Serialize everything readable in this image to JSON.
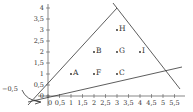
{
  "diagram": {
    "type": "coordinate-plane",
    "x_axis": {
      "ticks": [
        "0",
        "0,5",
        "1",
        "1,5",
        "2",
        "2,5",
        "3",
        "3,5",
        "4",
        "4,5",
        "5",
        "5,5"
      ]
    },
    "y_axis": {
      "ticks": [
        "0",
        "0,5",
        "1",
        "1,5",
        "2",
        "2,5",
        "3",
        "3,5",
        "4"
      ],
      "neg_label": "−0,5"
    },
    "points": [
      {
        "label": "A",
        "x": 1,
        "y": 1
      },
      {
        "label": "F",
        "x": 2,
        "y": 1
      },
      {
        "label": "C",
        "x": 3,
        "y": 1
      },
      {
        "label": "B",
        "x": 2,
        "y": 2
      },
      {
        "label": "G",
        "x": 3,
        "y": 2
      },
      {
        "label": "I",
        "x": 4,
        "y": 2
      },
      {
        "label": "H",
        "x": 3,
        "y": 3
      }
    ],
    "lines": [
      {
        "name": "left-side",
        "from": [
          -0.9,
          -0.4
        ],
        "to": [
          3,
          4
        ]
      },
      {
        "name": "right-side",
        "from": [
          3,
          4
        ],
        "to": [
          5.8,
          0.4
        ]
      },
      {
        "name": "base",
        "from": [
          -0.9,
          -0.3
        ],
        "to": [
          5.9,
          1.4
        ]
      }
    ],
    "colors": {
      "line": "#333333",
      "axis": "#555555"
    }
  }
}
